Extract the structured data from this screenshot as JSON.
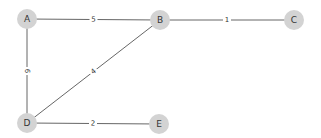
{
  "graph": {
    "nodes": [
      {
        "id": "A",
        "label": "A",
        "x": 27,
        "y": 19
      },
      {
        "id": "B",
        "label": "B",
        "x": 160,
        "y": 20
      },
      {
        "id": "C",
        "label": "C",
        "x": 294,
        "y": 20
      },
      {
        "id": "D",
        "label": "D",
        "x": 27,
        "y": 123
      },
      {
        "id": "E",
        "label": "E",
        "x": 159,
        "y": 124
      }
    ],
    "edges": [
      {
        "source": "A",
        "target": "B",
        "weight": "5"
      },
      {
        "source": "B",
        "target": "C",
        "weight": "1"
      },
      {
        "source": "A",
        "target": "D",
        "weight": "6"
      },
      {
        "source": "B",
        "target": "D",
        "weight": "4"
      },
      {
        "source": "D",
        "target": "E",
        "weight": "2"
      }
    ]
  },
  "colors": {
    "node_fill": "#d3d3d3",
    "edge": "#555555",
    "background": "#ffffff"
  }
}
